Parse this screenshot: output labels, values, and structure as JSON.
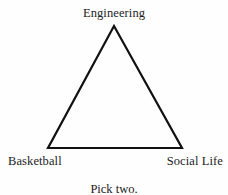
{
  "figure": {
    "type": "tradeoff-triangle",
    "background_color": "#fefefe",
    "stroke_color": "#111111",
    "text_color": "#1c1c1c",
    "vertices": {
      "top": "Engineering",
      "bottom_left": "Basketball",
      "bottom_right": "Social Life"
    },
    "caption": "Pick two.",
    "geometry": {
      "apex_x": 114,
      "apex_y": 26,
      "base_left_x": 48,
      "base_right_x": 182,
      "base_y": 148,
      "stroke_width": 2.2
    }
  }
}
